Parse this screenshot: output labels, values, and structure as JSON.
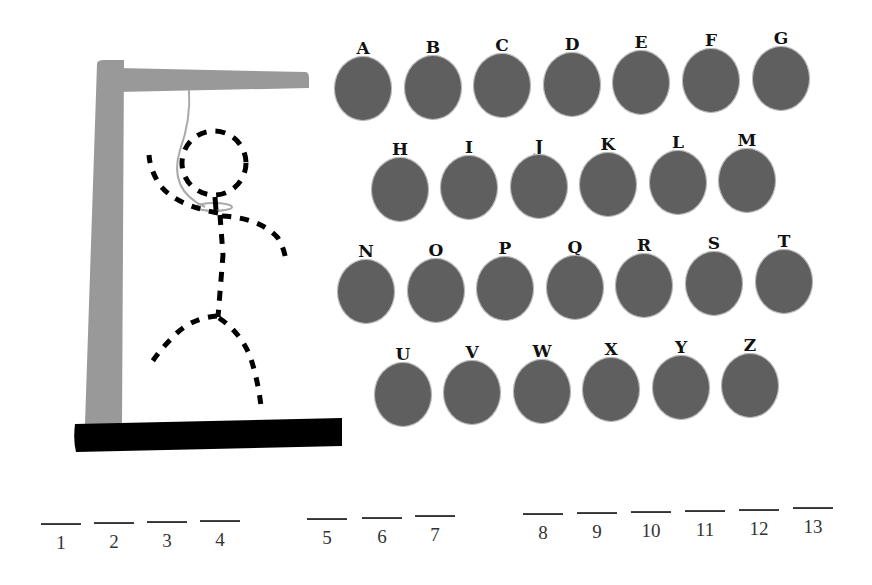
{
  "game": {
    "type": "hangman",
    "colors": {
      "button_fill": "#5f5f5f",
      "button_border": "#b9b9b9",
      "gallows_post": "#999999",
      "gallows_base": "#000000",
      "figure": "#000000",
      "rope": "#aaaaaa"
    }
  },
  "letters": {
    "rows": [
      [
        "A",
        "B",
        "C",
        "D",
        "E",
        "F",
        "G"
      ],
      [
        "H",
        "I",
        "J",
        "K",
        "L",
        "M"
      ],
      [
        "N",
        "O",
        "P",
        "Q",
        "R",
        "S",
        "T"
      ],
      [
        "U",
        "V",
        "W",
        "X",
        "Y",
        "Z"
      ]
    ],
    "A": "A",
    "B": "B",
    "C": "C",
    "D": "D",
    "E": "E",
    "F": "F",
    "G": "G",
    "H": "H",
    "I": "I",
    "J": "J",
    "K": "K",
    "L": "L",
    "M": "M",
    "N": "N",
    "O": "O",
    "P": "P",
    "Q": "Q",
    "R": "R",
    "S": "S",
    "T": "T",
    "U": "U",
    "V": "V",
    "W": "W",
    "X": "X",
    "Y": "Y",
    "Z": "Z"
  },
  "word": {
    "groups": [
      [
        "1",
        "2",
        "3",
        "4"
      ],
      [
        "5",
        "6",
        "7"
      ],
      [
        "8",
        "9",
        "10",
        "11",
        "12",
        "13"
      ]
    ],
    "slots": [
      "1",
      "2",
      "3",
      "4",
      "5",
      "6",
      "7",
      "8",
      "9",
      "10",
      "11",
      "12",
      "13"
    ]
  },
  "figure": {
    "parts_shown": [
      "head",
      "body",
      "left-arm",
      "right-arm",
      "left-leg",
      "right-leg"
    ],
    "style": "dashed"
  }
}
